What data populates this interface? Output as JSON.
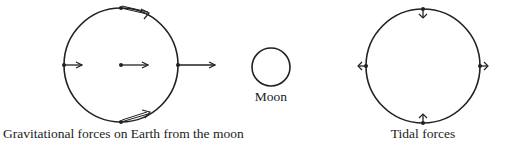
{
  "diagram": {
    "stroke_color": "#222222",
    "earth_left": {
      "caption": "Gravitational forces on Earth from the moon",
      "center": [
        121,
        65
      ],
      "radius": 57,
      "force_arrows": [
        "top (double, tangential-right)",
        "left (short)",
        "center (medium)",
        "right (long)",
        "bottom (double, tangential-right)"
      ]
    },
    "moon": {
      "label": "Moon",
      "center": [
        271,
        67
      ],
      "radius": 19
    },
    "earth_right": {
      "caption": "Tidal forces",
      "center": [
        423,
        66
      ],
      "radius": 57,
      "force_arrows": [
        "top (inward)",
        "bottom (inward)",
        "left (outward)",
        "right (outward)"
      ]
    }
  }
}
